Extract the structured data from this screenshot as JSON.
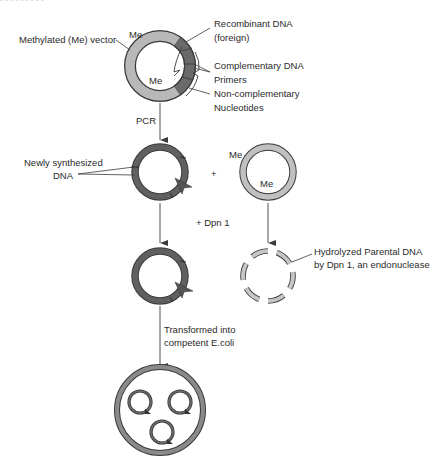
{
  "colors": {
    "vector_light": "#b8b8b8",
    "insert_dark": "#6a6a6a",
    "new_dna_dark": "#606060",
    "outline": "#3a3a3a",
    "line": "#3a3a3a",
    "text": "#2a2a2a"
  },
  "step1": {
    "methyl_labels": [
      "Me",
      "Me"
    ],
    "labels": {
      "vector": "Methylated (Me) vector",
      "recombinant": "Recombinant DNA",
      "recombinant_note": "(foreign)",
      "complementary": "Complementary DNA",
      "primers": "Primers",
      "noncomp": "Non-complementary",
      "nucleotides": "Nucleotides"
    }
  },
  "arrows": {
    "pcr": "PCR",
    "dpn": "+ Dpn 1",
    "plus": "+",
    "transform_line1": "Transformed into",
    "transform_line2": "competent E.coli"
  },
  "step2": {
    "new_dna_line1": "Newly synthesized",
    "new_dna_line2": "DNA",
    "parent_methyl_labels": [
      "Me",
      "Me"
    ]
  },
  "step3": {
    "hydrolyzed_line1": "Hydrolyzed Parental DNA",
    "hydrolyzed_line2": "by Dpn 1, an endonuclease"
  },
  "step4": {
    "plasmid_count": 3
  }
}
